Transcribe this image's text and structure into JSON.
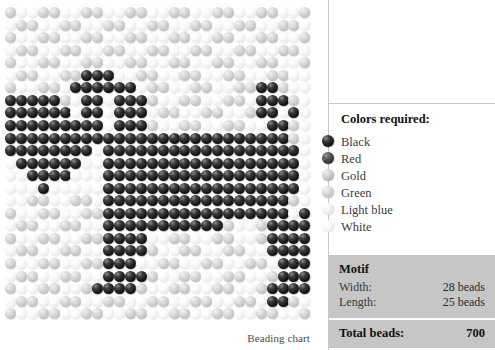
{
  "chart": {
    "caption": "Beading chart",
    "grid": {
      "columns": 28,
      "rows": 25,
      "cell_pitch_x": 10.9,
      "cell_pitch_y": 12.55,
      "bead_size": 11
    },
    "palette": {
      "black": "#0a0a0a",
      "red": "#2a2a2a",
      "gold": "#b8b8b8",
      "green": "#c3c3c3",
      "light_blue": "#e2e7ea",
      "white": "#f4f4f4"
    },
    "legend_key": {
      "W": "white",
      "L": "lightblue",
      "G": "green",
      "O": "gold",
      "R": "red",
      "K": "black"
    },
    "pattern": [
      "GWWGGWWGGWWGGWWGGWWGGWWGGWWG",
      "WGGWWGGWWGGWWGGWWGGWWGGWWGGW",
      "GWWGGWWGGWWGGWWGGWWGGWWGGWWG",
      "WGGWWGGWWGGWWGGWWGGWWGGWWGGW",
      "GWWGGWWGGWWGGWWGGWWGGWWGGWWG",
      "WGGWWGGKKKWWGGWWGGWWGGWWGGWW",
      "GWWGGWKKKKKKWGGWWGGWWGGKKGWW",
      "KKKKKGWKKWKKKGWWGGWWGGWKKKGW",
      "KKKKKKWKKWKKKWGGWWGGWWGKKWKW",
      "KKKKKKKKKWKKKGWWGGWWGGWWKKGW",
      "KKKKKKKKKKKKKKKKKKKKKKKKKKGW",
      "KKKKKKKKWKKKKKKKKKKKKKKKKKKW",
      "WKKKKKKWWKKKKKKKKKKKKKKKKKKW",
      "WWKKKKWWWKKKKKKKKKKKKKKKKKKW",
      "WWWKWWWWWKKKKKKKKKKKKKKKKKKW",
      "WWGGWWGGWKKKKKKKKKKKKKKKKKGW",
      "GWWGGWWGGKKKKKKKKKKKKKKKKKWK",
      "WGGWWGGWWKKKKKKKKKKKGWWGKKKK",
      "GWWGGWWGGKKKKWWGGWWGGWWGKKKK",
      "WGGWWGGWWKKKKGWWGGWWGGWWKKKK",
      "GWWGGWWGGKKKWWGGWWGGWWGGWKKK",
      "WGGWWGGWWKKKKGWWGGWWGGWWGKKK",
      "GWWGGWWGKKKKGWWGGWWGGWWGKKKK",
      "WGGWWGGWWGGWWGGWWGGWWGGWKKGW",
      "GWWGGWWGGWWGGWWGGWWGGWWGGWWG"
    ]
  },
  "legend": {
    "title": "Colors required:",
    "items": [
      {
        "label": "Black",
        "swatch": "black"
      },
      {
        "label": "Red",
        "swatch": "red"
      },
      {
        "label": "Gold",
        "swatch": "gold"
      },
      {
        "label": "Green",
        "swatch": "green"
      },
      {
        "label": "Light blue",
        "swatch": "lightblue"
      },
      {
        "label": "White",
        "swatch": "white"
      }
    ]
  },
  "motif": {
    "heading": "Motif",
    "width_label": "Width:",
    "width_value": "28 beads",
    "length_label": "Length:",
    "length_value": "25 beads",
    "total_label": "Total beads:",
    "total_value": "700"
  }
}
